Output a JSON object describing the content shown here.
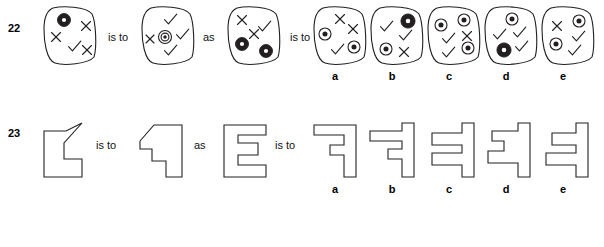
{
  "page": {
    "width": 604,
    "height": 247,
    "background": "#ffffff",
    "ink": "#231f20",
    "stroke_width": 1.1
  },
  "connectors": {
    "is_to": "is to",
    "as": "as"
  },
  "option_labels": [
    "a",
    "b",
    "c",
    "d",
    "e"
  ],
  "glyph_legend": {
    "cross": "x-mark",
    "check": "check-mark",
    "donut": "filled-ring-small",
    "ring": "ring-with-dot",
    "bullseye": "concentric-bullseye"
  },
  "questions": [
    {
      "number": "22",
      "type": "blob-with-symbols",
      "stem": [
        {
          "name": "q22-stem-1",
          "shape": "rounded-blob",
          "marks": [
            {
              "glyph": "donut",
              "x": 22,
              "y": 14,
              "size": 11,
              "rot": 0
            },
            {
              "glyph": "cross",
              "x": 44,
              "y": 20,
              "size": 9,
              "rot": 0
            },
            {
              "glyph": "cross",
              "x": 14,
              "y": 31,
              "size": 9,
              "rot": 0
            },
            {
              "glyph": "check",
              "x": 32,
              "y": 41,
              "size": 13,
              "rot": 0
            },
            {
              "glyph": "cross",
              "x": 45,
              "y": 44,
              "size": 9,
              "rot": 0
            }
          ]
        },
        {
          "name": "q22-stem-2",
          "shape": "rounded-blob",
          "marks": [
            {
              "glyph": "check",
              "x": 30,
              "y": 14,
              "size": 13,
              "rot": 0
            },
            {
              "glyph": "cross",
              "x": 10,
              "y": 33,
              "size": 8,
              "rot": 0
            },
            {
              "glyph": "bullseye",
              "x": 25,
              "y": 31,
              "size": 13,
              "rot": 0
            },
            {
              "glyph": "check",
              "x": 42,
              "y": 29,
              "size": 13,
              "rot": 0
            },
            {
              "glyph": "check",
              "x": 30,
              "y": 45,
              "size": 13,
              "rot": 0
            }
          ]
        },
        {
          "name": "q22-stem-3",
          "shape": "rounded-blob",
          "marks": [
            {
              "glyph": "cross",
              "x": 16,
              "y": 14,
              "size": 9,
              "rot": 0
            },
            {
              "glyph": "check",
              "x": 38,
              "y": 21,
              "size": 13,
              "rot": 0
            },
            {
              "glyph": "cross",
              "x": 28,
              "y": 28,
              "size": 9,
              "rot": 0
            },
            {
              "glyph": "donut",
              "x": 16,
              "y": 38,
              "size": 11,
              "rot": 0
            },
            {
              "glyph": "donut",
              "x": 40,
              "y": 45,
              "size": 11,
              "rot": 0
            }
          ]
        }
      ],
      "options": [
        {
          "label": "a",
          "name": "q22-option-a",
          "shape": "rounded-blob",
          "marks": [
            {
              "glyph": "cross",
              "x": 28,
              "y": 13,
              "size": 9,
              "rot": 0
            },
            {
              "glyph": "cross",
              "x": 41,
              "y": 23,
              "size": 9,
              "rot": 0
            },
            {
              "glyph": "ring",
              "x": 13,
              "y": 28,
              "size": 12,
              "rot": 0
            },
            {
              "glyph": "check",
              "x": 25,
              "y": 44,
              "size": 13,
              "rot": 0
            },
            {
              "glyph": "ring",
              "x": 42,
              "y": 41,
              "size": 12,
              "rot": 0
            }
          ]
        },
        {
          "label": "b",
          "name": "q22-option-b",
          "shape": "rounded-blob",
          "marks": [
            {
              "glyph": "check",
              "x": 17,
              "y": 21,
              "size": 13,
              "rot": 0
            },
            {
              "glyph": "donut",
              "x": 39,
              "y": 15,
              "size": 12,
              "rot": 0
            },
            {
              "glyph": "check",
              "x": 36,
              "y": 30,
              "size": 13,
              "rot": 0
            },
            {
              "glyph": "ring",
              "x": 17,
              "y": 43,
              "size": 12,
              "rot": 0
            },
            {
              "glyph": "cross",
              "x": 35,
              "y": 46,
              "size": 9,
              "rot": 0
            }
          ]
        },
        {
          "label": "c",
          "name": "q22-option-c",
          "shape": "rounded-blob",
          "marks": [
            {
              "glyph": "ring",
              "x": 15,
              "y": 19,
              "size": 12,
              "rot": 0
            },
            {
              "glyph": "ring",
              "x": 38,
              "y": 14,
              "size": 12,
              "rot": 0
            },
            {
              "glyph": "check",
              "x": 22,
              "y": 33,
              "size": 13,
              "rot": 0
            },
            {
              "glyph": "cross",
              "x": 41,
              "y": 30,
              "size": 9,
              "rot": 0
            },
            {
              "glyph": "ring",
              "x": 42,
              "y": 42,
              "size": 12,
              "rot": 0
            },
            {
              "glyph": "check",
              "x": 22,
              "y": 47,
              "size": 13,
              "rot": 0
            }
          ]
        },
        {
          "label": "d",
          "name": "q22-option-d",
          "shape": "rounded-blob",
          "marks": [
            {
              "glyph": "ring",
              "x": 29,
              "y": 13,
              "size": 12,
              "rot": 0
            },
            {
              "glyph": "check",
              "x": 16,
              "y": 29,
              "size": 13,
              "rot": 0
            },
            {
              "glyph": "check",
              "x": 36,
              "y": 27,
              "size": 13,
              "rot": 0
            },
            {
              "glyph": "donut",
              "x": 21,
              "y": 44,
              "size": 12,
              "rot": 0
            },
            {
              "glyph": "check",
              "x": 38,
              "y": 41,
              "size": 13,
              "rot": 0
            }
          ]
        },
        {
          "label": "e",
          "name": "q22-option-e",
          "shape": "rounded-blob",
          "marks": [
            {
              "glyph": "cross",
              "x": 17,
              "y": 20,
              "size": 9,
              "rot": 0
            },
            {
              "glyph": "ring",
              "x": 39,
              "y": 15,
              "size": 12,
              "rot": 0
            },
            {
              "glyph": "check",
              "x": 38,
              "y": 31,
              "size": 13,
              "rot": 0
            },
            {
              "glyph": "ring",
              "x": 16,
              "y": 38,
              "size": 12,
              "rot": 0
            },
            {
              "glyph": "check",
              "x": 34,
              "y": 45,
              "size": 13,
              "rot": 0
            }
          ]
        }
      ]
    },
    {
      "number": "23",
      "type": "polygon-outline",
      "stem": [
        {
          "name": "q23-stem-1",
          "points": "2,10 24,10 40,2 40,2 22,22 22,38 40,38 40,56 2,56",
          "viewbox": "0 0 46 62"
        },
        {
          "name": "q23-stem-2",
          "points": "2,22 16,6 44,6 44,58 28,58 28,42 14,42 14,30 2,30",
          "viewbox": "0 0 50 64"
        },
        {
          "name": "q23-stem-3",
          "points": "2,4 44,4 44,14 16,14 16,22 36,22 36,34 16,34 16,44 44,44 44,56 2,56",
          "viewbox": "0 0 50 62"
        }
      ],
      "options": [
        {
          "label": "a",
          "name": "q23-option-a",
          "points": "2,6 44,6 44,58 32,58 32,36 18,36 18,26 32,26 32,16 2,16",
          "viewbox": "0 0 50 64"
        },
        {
          "label": "b",
          "name": "q23-option-b",
          "points": "34,4 46,4 46,58 34,58 34,40 20,40 20,30 34,30 34,22 2,22 2,12 34,12",
          "viewbox": "0 0 52 64"
        },
        {
          "label": "c",
          "name": "q23-option-c",
          "points": "38,4 50,4 50,58 38,58 38,46 8,46 8,34 38,34 38,26 8,26 8,14 38,14",
          "viewbox": "0 0 54 64"
        },
        {
          "label": "d",
          "name": "q23-option-d",
          "points": "36,4 48,4 48,58 36,58 36,44 6,44 6,32 22,32 22,22 10,22 10,12 36,12",
          "viewbox": "0 0 52 64"
        },
        {
          "label": "e",
          "name": "q23-option-e",
          "points": "38,4 50,4 50,58 38,58 38,46 8,46 8,34 38,34 38,26 14,26 14,14 38,14",
          "viewbox": "0 0 54 64"
        }
      ]
    }
  ]
}
